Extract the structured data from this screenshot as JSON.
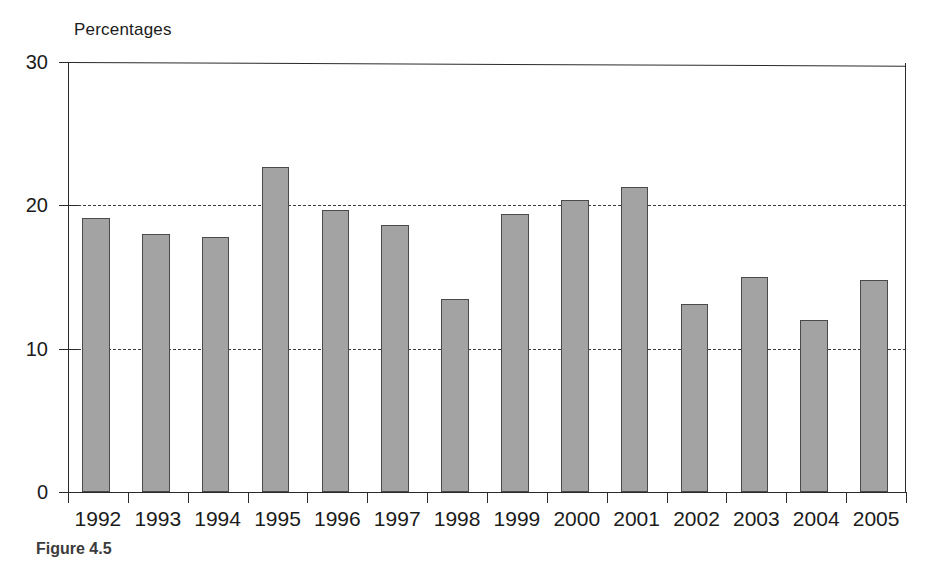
{
  "figure": {
    "axis_title": "Percentages",
    "caption_label": "Figure 4.5",
    "caption_rest": "",
    "bar_fill_color": "#a3a3a3",
    "bar_edge_color": "#4a4a4a",
    "grid_color": "#3a3a3a",
    "axis_color": "#2a2a2a"
  },
  "chart_data": {
    "type": "bar",
    "title": "",
    "subtitle": "",
    "xlabel": "",
    "ylabel": "Percentages",
    "ylim": [
      0,
      30
    ],
    "yticks": [
      0,
      10,
      20,
      30
    ],
    "ytick_labels": [
      "0",
      "10",
      "20",
      "30"
    ],
    "grid": true,
    "gridlines_at": [
      10,
      20
    ],
    "grid_style": "dashed",
    "legend": null,
    "legend_position": "none",
    "categories": [
      "1992",
      "1993",
      "1994",
      "1995",
      "1996",
      "1997",
      "1998",
      "1999",
      "2000",
      "2001",
      "2002",
      "2003",
      "2004",
      "2005"
    ],
    "values": [
      19.1,
      18.0,
      17.8,
      22.7,
      19.7,
      18.6,
      13.5,
      19.4,
      20.4,
      21.3,
      13.1,
      15.0,
      12.0,
      14.8
    ],
    "annotations": []
  }
}
